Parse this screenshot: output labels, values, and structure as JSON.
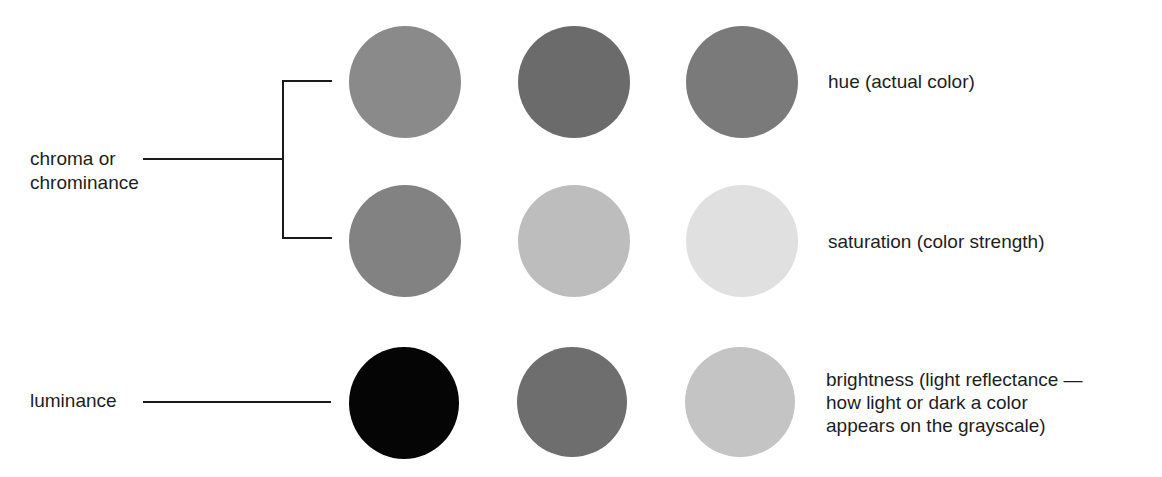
{
  "figure": {
    "left_labels": {
      "chroma": [
        "chroma or",
        "chrominance"
      ],
      "luminance": "luminance"
    },
    "rows": [
      {
        "name": "hue",
        "description": [
          "hue (actual color)"
        ],
        "swatches": [
          {
            "fill": "#8a8a8a"
          },
          {
            "fill": "#6b6b6b"
          },
          {
            "fill": "#7a7a7a"
          }
        ]
      },
      {
        "name": "saturation",
        "description": [
          "saturation (color strength)"
        ],
        "swatches": [
          {
            "fill": "#828282"
          },
          {
            "fill": "#bdbdbd"
          },
          {
            "fill": "#e0e0e0"
          }
        ]
      },
      {
        "name": "brightness",
        "description": [
          "brightness (light reflectance —",
          "how light or dark a color",
          "appears on the grayscale)"
        ],
        "swatches": [
          {
            "fill": "#050505"
          },
          {
            "fill": "#6e6e6e"
          },
          {
            "fill": "#c4c4c4"
          }
        ]
      }
    ],
    "colors": {
      "line": "#1a1a1a",
      "text": "#1e1e1e",
      "background": "#ffffff"
    }
  }
}
